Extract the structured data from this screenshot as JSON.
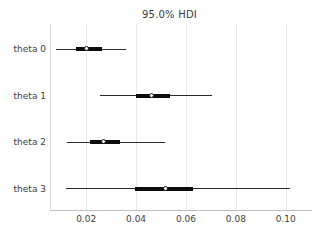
{
  "chart_data": {
    "type": "scatter",
    "title": "95.0% HDI",
    "xlabel": "",
    "ylabel": "",
    "xlim": [
      0.0055,
      0.1105
    ],
    "xticks": [
      0.02,
      0.04,
      0.06,
      0.08,
      0.1
    ],
    "xtick_labels": [
      "0.02",
      "0.04",
      "0.06",
      "0.08",
      "0.10"
    ],
    "categories": [
      "theta 0",
      "theta 1",
      "theta 2",
      "theta 3"
    ],
    "grid": "vertical",
    "legend": "none",
    "series": [
      {
        "name": "theta 0",
        "point_estimate": 0.0205,
        "hdi_94": [
          0.008,
          0.036
        ],
        "hdi_50": [
          0.016,
          0.0265
        ]
      },
      {
        "name": "theta 1",
        "point_estimate": 0.0465,
        "hdi_94": [
          0.0255,
          0.0705
        ],
        "hdi_50": [
          0.04,
          0.0535
        ]
      },
      {
        "name": "theta 2",
        "point_estimate": 0.027,
        "hdi_94": [
          0.0125,
          0.0515
        ],
        "hdi_50": [
          0.0215,
          0.0335
        ]
      },
      {
        "name": "theta 3",
        "point_estimate": 0.052,
        "hdi_94": [
          0.012,
          0.1015
        ],
        "hdi_50": [
          0.0395,
          0.063
        ]
      }
    ]
  },
  "colors": {
    "line": "#2b2b2b",
    "thick_line": "#0d0d0d",
    "point_face": "#ffffff",
    "point_edge": "#1a1a1a",
    "grid": "#e9e9e9",
    "text": "#404040",
    "title_text": "#3a3a3a",
    "background": "#ffffff"
  }
}
